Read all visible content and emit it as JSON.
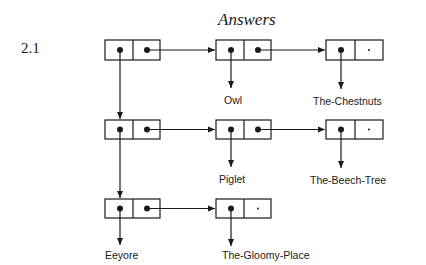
{
  "page": {
    "title": "Answers",
    "section_number": "2.1"
  },
  "diagram": {
    "type": "cons-cell list structure",
    "rows": [
      {
        "spine_cell": {
          "car": "pointer",
          "cdr": "pointer"
        },
        "list": [
          {
            "car_label": "Owl",
            "cdr": "pointer"
          },
          {
            "car_label": "The-Chestnuts",
            "cdr": "nil"
          }
        ]
      },
      {
        "spine_cell": {
          "car": "pointer",
          "cdr": "pointer"
        },
        "list": [
          {
            "car_label": "Piglet",
            "cdr": "pointer"
          },
          {
            "car_label": "The-Beech-Tree",
            "cdr": "nil"
          }
        ]
      },
      {
        "spine_cell": {
          "car": "pointer",
          "cdr": "pointer"
        },
        "car_label": "Eeyore",
        "list": [
          {
            "car_label": "The-Gloomy-Place",
            "cdr": "nil"
          }
        ]
      }
    ],
    "labels": {
      "owl": "Owl",
      "chestnuts": "The-Chestnuts",
      "piglet": "Piglet",
      "beech": "The-Beech-Tree",
      "eeyore": "Eeyore",
      "gloomy": "The-Gloomy-Place"
    },
    "nil_marker": "*",
    "colors": {
      "ink": "#1a1a1a",
      "background": "#ffffff"
    }
  }
}
